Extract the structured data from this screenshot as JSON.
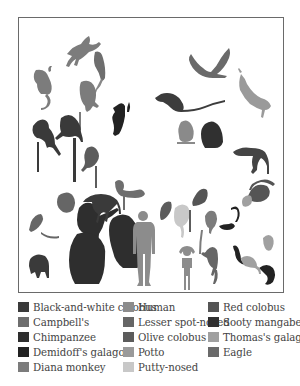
{
  "colors": {
    "black_and_white_colobus": "#3a3a3a",
    "campbells": "#6e6e6e",
    "chimpanzee": "#2e2e2e",
    "demidoffs_galago": "#222222",
    "diana_monkey": "#7c7c7c",
    "human": "#8c8c8c",
    "lesser_spot_nosed": "#666666",
    "olive_colobus": "#5c5c5c",
    "potto": "#9a9a9a",
    "putty_nosed": "#c8c8c8",
    "red_colobus": "#555555",
    "sooty_mangabey": "#303030",
    "thomas_galago": "#a0a0a0",
    "eagle": "#6a6a6a"
  },
  "legend": {
    "items": [
      {
        "label": "Black-and-white colobus",
        "color": "#3a3a3a"
      },
      {
        "label": "Campbell's",
        "color": "#6e6e6e"
      },
      {
        "label": "Chimpanzee",
        "color": "#2e2e2e"
      },
      {
        "label": "Demidoff's galago",
        "color": "#222222"
      },
      {
        "label": "Diana monkey",
        "color": "#7c7c7c"
      },
      {
        "label": "Human",
        "color": "#8c8c8c"
      },
      {
        "label": "Lesser spot-nosed",
        "color": "#666666"
      },
      {
        "label": "Olive colobus",
        "color": "#5c5c5c"
      },
      {
        "label": "Potto",
        "color": "#9a9a9a"
      },
      {
        "label": "Putty-nosed",
        "color": "#c8c8c8"
      },
      {
        "label": "Red colobus",
        "color": "#555555"
      },
      {
        "label": "Sooty mangabey",
        "color": "#303030"
      },
      {
        "label": "Thomas's galago",
        "color": "#a0a0a0"
      },
      {
        "label": "Eagle",
        "color": "#6a6a6a"
      }
    ]
  }
}
